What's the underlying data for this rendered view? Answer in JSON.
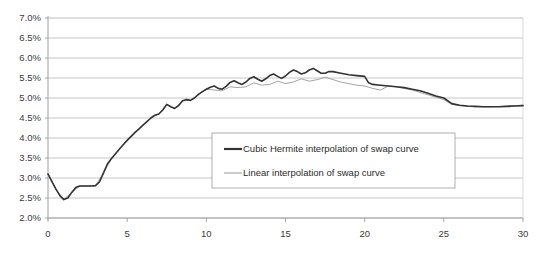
{
  "chart_data": {
    "type": "line",
    "title": "",
    "xlabel": "",
    "ylabel": "",
    "xlim": [
      0,
      30
    ],
    "ylim": [
      0.02,
      0.07
    ],
    "grid": true,
    "grid_axis": "y",
    "legend_position": "center-lower",
    "xticks": [
      "0",
      "5",
      "10",
      "15",
      "20",
      "25",
      "30"
    ],
    "xtick_values": [
      0,
      5,
      10,
      15,
      20,
      25,
      30
    ],
    "yticks": [
      "2.0%",
      "2.5%",
      "3.0%",
      "3.5%",
      "4.0%",
      "4.5%",
      "5.0%",
      "5.5%",
      "6.0%",
      "6.5%",
      "7.0%"
    ],
    "ytick_values": [
      0.02,
      0.025,
      0.03,
      0.035,
      0.04,
      0.045,
      0.05,
      0.055,
      0.06,
      0.065,
      0.07
    ],
    "series": [
      {
        "name": "Cubic Hermite interpolation of swap curve",
        "color": "#333333",
        "width": 1.6,
        "x": [
          0.0,
          0.25,
          0.5,
          0.75,
          1.0,
          1.25,
          1.5,
          1.75,
          2.0,
          2.25,
          2.5,
          2.75,
          3.0,
          3.25,
          3.5,
          3.75,
          4.0,
          4.25,
          4.5,
          4.75,
          5.0,
          5.25,
          5.5,
          5.75,
          6.0,
          6.25,
          6.5,
          6.75,
          7.0,
          7.25,
          7.5,
          7.75,
          8.0,
          8.25,
          8.5,
          8.75,
          9.0,
          9.25,
          9.5,
          9.75,
          10.0,
          10.25,
          10.5,
          10.75,
          11.0,
          11.25,
          11.5,
          11.75,
          12.0,
          12.25,
          12.5,
          12.75,
          13.0,
          13.25,
          13.5,
          13.75,
          14.0,
          14.25,
          14.5,
          14.75,
          15.0,
          15.25,
          15.5,
          15.75,
          16.0,
          16.25,
          16.5,
          16.75,
          17.0,
          17.25,
          17.5,
          17.75,
          18.0,
          18.5,
          19.0,
          19.5,
          20.0,
          20.25,
          20.5,
          21.0,
          21.5,
          22.0,
          22.5,
          23.0,
          23.5,
          24.0,
          24.5,
          25.0,
          25.5,
          26.0,
          26.5,
          27.0,
          27.5,
          28.0,
          28.5,
          29.0,
          29.5,
          30.0
        ],
        "y": [
          0.031,
          0.0291,
          0.0272,
          0.0256,
          0.0246,
          0.025,
          0.0264,
          0.0276,
          0.028,
          0.028,
          0.028,
          0.028,
          0.0281,
          0.029,
          0.0312,
          0.0335,
          0.0348,
          0.036,
          0.0372,
          0.0383,
          0.0394,
          0.0404,
          0.0414,
          0.0423,
          0.0432,
          0.0441,
          0.045,
          0.0457,
          0.046,
          0.047,
          0.0484,
          0.0478,
          0.0474,
          0.0481,
          0.0493,
          0.0496,
          0.0494,
          0.05,
          0.0509,
          0.0516,
          0.0522,
          0.0527,
          0.053,
          0.0524,
          0.0522,
          0.0529,
          0.0539,
          0.0543,
          0.0538,
          0.0534,
          0.054,
          0.0549,
          0.0553,
          0.0547,
          0.0542,
          0.0548,
          0.0556,
          0.056,
          0.0554,
          0.0549,
          0.0555,
          0.0564,
          0.057,
          0.0566,
          0.056,
          0.0563,
          0.057,
          0.0574,
          0.0568,
          0.0562,
          0.0562,
          0.0566,
          0.0566,
          0.0562,
          0.0558,
          0.0556,
          0.0554,
          0.0538,
          0.0534,
          0.0532,
          0.053,
          0.0528,
          0.0526,
          0.0522,
          0.0518,
          0.0512,
          0.0505,
          0.05,
          0.0486,
          0.0482,
          0.048,
          0.0479,
          0.0478,
          0.0478,
          0.0478,
          0.0479,
          0.048,
          0.0481
        ]
      },
      {
        "name": "Linear interpolation of swap curve",
        "color": "#8c8c8c",
        "width": 0.8,
        "x": [
          0.0,
          0.5,
          1.0,
          1.5,
          2.0,
          2.5,
          3.0,
          3.5,
          4.0,
          4.5,
          5.0,
          5.5,
          6.0,
          6.5,
          7.0,
          7.5,
          8.0,
          8.5,
          9.0,
          9.5,
          10.0,
          10.5,
          11.0,
          11.5,
          12.0,
          12.5,
          13.0,
          13.5,
          14.0,
          14.5,
          15.0,
          15.5,
          16.0,
          16.5,
          17.0,
          17.5,
          18.0,
          18.5,
          19.0,
          19.5,
          20.0,
          20.5,
          21.0,
          21.5,
          22.0,
          22.5,
          23.0,
          23.5,
          24.0,
          24.5,
          25.0,
          25.5,
          26.0,
          26.5,
          27.0,
          27.5,
          28.0,
          28.5,
          29.0,
          29.5,
          30.0
        ],
        "y": [
          0.031,
          0.0272,
          0.0246,
          0.0264,
          0.028,
          0.028,
          0.0281,
          0.0312,
          0.0348,
          0.0372,
          0.0394,
          0.0414,
          0.0432,
          0.045,
          0.046,
          0.0484,
          0.0474,
          0.0493,
          0.0494,
          0.0509,
          0.0522,
          0.052,
          0.0518,
          0.0528,
          0.0526,
          0.0528,
          0.0538,
          0.0532,
          0.0534,
          0.0542,
          0.0536,
          0.054,
          0.0548,
          0.0542,
          0.0546,
          0.0552,
          0.0546,
          0.054,
          0.0536,
          0.0532,
          0.053,
          0.0524,
          0.052,
          0.053,
          0.0528,
          0.0524,
          0.052,
          0.0514,
          0.0508,
          0.0502,
          0.0496,
          0.0484,
          0.0481,
          0.0479,
          0.0478,
          0.0478,
          0.0478,
          0.0479,
          0.048,
          0.0481,
          0.0482
        ]
      }
    ]
  },
  "legend": {
    "entries": [
      {
        "label": "Cubic Hermite interpolation of swap curve",
        "color": "#333333",
        "width": 2.2
      },
      {
        "label": "Linear interpolation of swap curve",
        "color": "#8c8c8c",
        "width": 0.9
      }
    ]
  },
  "colors": {
    "grid": "#bfbfbf",
    "axis": "#a6a6a6",
    "plot_border": "#d9d9d9",
    "background": "#ffffff",
    "tick_text": "#3b3b3b",
    "legend_border": "#a6a6a6"
  },
  "geometry": {
    "plot_left": 48,
    "plot_right": 523,
    "plot_top": 18,
    "plot_bottom": 218,
    "legend_x": 212,
    "legend_y": 133,
    "legend_w": 243,
    "legend_h": 55
  }
}
